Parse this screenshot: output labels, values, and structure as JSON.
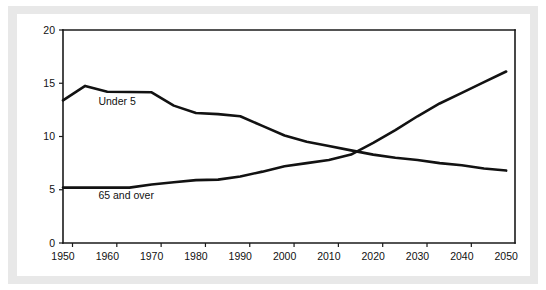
{
  "figure": {
    "background_color": "#ffffff",
    "frame_color": "#e8e8e8",
    "line_color": "#121212"
  },
  "chart_data": {
    "type": "line",
    "title": "",
    "subtitle": "",
    "xlabel": "",
    "ylabel": "",
    "xlim": [
      1950,
      2052
    ],
    "ylim": [
      0,
      20
    ],
    "grid": false,
    "legend_position": "inline-annotation",
    "xticks": [
      1950,
      1960,
      1970,
      1980,
      1990,
      2000,
      2010,
      2020,
      2030,
      2040,
      2050
    ],
    "xtick_labels": [
      "1950",
      "1960",
      "1970",
      "1980",
      "1990",
      "2000",
      "2010",
      "2020",
      "2030",
      "2040",
      "2050"
    ],
    "yticks": [
      0,
      5,
      10,
      15,
      20
    ],
    "ytick_labels": [
      "0",
      "5",
      "10",
      "15",
      "20"
    ],
    "series": [
      {
        "name": "Under 5",
        "label_x": 1958,
        "label_y": 13.0,
        "x": [
          1950,
          1955,
          1960,
          1970,
          1975,
          1980,
          1985,
          1990,
          1995,
          2000,
          2005,
          2010,
          2015,
          2020,
          2025,
          2030,
          2035,
          2040,
          2045,
          2050
        ],
        "values": [
          13.4,
          14.75,
          14.2,
          14.15,
          12.9,
          12.2,
          12.1,
          11.9,
          11.0,
          10.1,
          9.5,
          9.1,
          8.7,
          8.3,
          8.0,
          7.8,
          7.5,
          7.3,
          7.0,
          6.8
        ]
      },
      {
        "name": "65 and over",
        "label_x": 1958,
        "label_y": 4.1,
        "x": [
          1950,
          1955,
          1960,
          1965,
          1970,
          1975,
          1980,
          1985,
          1990,
          1995,
          2000,
          2005,
          2010,
          2015,
          2020,
          2025,
          2030,
          2035,
          2040,
          2045,
          2050
        ],
        "values": [
          5.2,
          5.2,
          5.2,
          5.2,
          5.5,
          5.7,
          5.9,
          5.95,
          6.25,
          6.7,
          7.2,
          7.5,
          7.8,
          8.3,
          9.4,
          10.6,
          11.9,
          13.1,
          14.1,
          15.1,
          16.1
        ]
      }
    ]
  }
}
